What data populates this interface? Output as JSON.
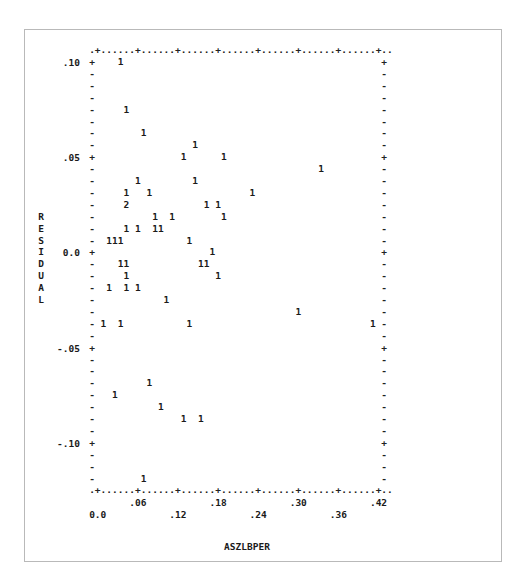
{
  "chart_data": {
    "type": "scatter",
    "title": "",
    "xlabel": "ASZLBPER",
    "ylabel": "RESIDUAL",
    "x_ticks": [
      "0.0",
      ".06",
      ".12",
      ".18",
      ".24",
      ".30",
      ".36",
      ".42"
    ],
    "y_ticks": [
      ".10",
      ".05",
      "0.0",
      "-.05",
      "-.10"
    ],
    "xlim": [
      0.0,
      0.42
    ],
    "ylim": [
      -0.125,
      0.1
    ],
    "grid": false,
    "legend": "symbols denote number of observations at plotted position",
    "points": [
      {
        "row": 0,
        "col": 5,
        "sym": "1",
        "x": 0.034,
        "y": 0.1
      },
      {
        "row": 4,
        "col": 6,
        "sym": "1",
        "x": 0.043,
        "y": 0.075
      },
      {
        "row": 6,
        "col": 9,
        "sym": "1",
        "x": 0.069,
        "y": 0.0625
      },
      {
        "row": 7,
        "col": 18,
        "sym": "1",
        "x": 0.146,
        "y": 0.056
      },
      {
        "row": 8,
        "col": 16,
        "sym": "1",
        "x": 0.129,
        "y": 0.05
      },
      {
        "row": 8,
        "col": 23,
        "sym": "1",
        "x": 0.189,
        "y": 0.05
      },
      {
        "row": 9,
        "col": 40,
        "sym": "1",
        "x": 0.334,
        "y": 0.044
      },
      {
        "row": 10,
        "col": 8,
        "sym": "1",
        "x": 0.06,
        "y": 0.0375
      },
      {
        "row": 10,
        "col": 18,
        "sym": "1",
        "x": 0.146,
        "y": 0.0375
      },
      {
        "row": 11,
        "col": 6,
        "sym": "1",
        "x": 0.043,
        "y": 0.031
      },
      {
        "row": 11,
        "col": 10,
        "sym": "1",
        "x": 0.077,
        "y": 0.031
      },
      {
        "row": 11,
        "col": 28,
        "sym": "1",
        "x": 0.231,
        "y": 0.031
      },
      {
        "row": 12,
        "col": 6,
        "sym": "2",
        "x": 0.043,
        "y": 0.025
      },
      {
        "row": 12,
        "col": 20,
        "sym": "1",
        "x": 0.163,
        "y": 0.025
      },
      {
        "row": 12,
        "col": 22,
        "sym": "1",
        "x": 0.18,
        "y": 0.025
      },
      {
        "row": 13,
        "col": 11,
        "sym": "1",
        "x": 0.086,
        "y": 0.019
      },
      {
        "row": 13,
        "col": 14,
        "sym": "1",
        "x": 0.111,
        "y": 0.019
      },
      {
        "row": 13,
        "col": 23,
        "sym": "1",
        "x": 0.189,
        "y": 0.019
      },
      {
        "row": 14,
        "col": 6,
        "sym": "1",
        "x": 0.043,
        "y": 0.0125
      },
      {
        "row": 14,
        "col": 8,
        "sym": "1",
        "x": 0.06,
        "y": 0.0125
      },
      {
        "row": 14,
        "col": 11,
        "sym": "1",
        "x": 0.086,
        "y": 0.0125
      },
      {
        "row": 14,
        "col": 12,
        "sym": "1",
        "x": 0.094,
        "y": 0.0125
      },
      {
        "row": 15,
        "col": 3,
        "sym": "1",
        "x": 0.017,
        "y": 0.006
      },
      {
        "row": 15,
        "col": 4,
        "sym": "1",
        "x": 0.026,
        "y": 0.006
      },
      {
        "row": 15,
        "col": 5,
        "sym": "1",
        "x": 0.034,
        "y": 0.006
      },
      {
        "row": 15,
        "col": 17,
        "sym": "1",
        "x": 0.137,
        "y": 0.006
      },
      {
        "row": 16,
        "col": 21,
        "sym": "1",
        "x": 0.171,
        "y": 0.0
      },
      {
        "row": 17,
        "col": 5,
        "sym": "1",
        "x": 0.034,
        "y": -0.006
      },
      {
        "row": 17,
        "col": 6,
        "sym": "1",
        "x": 0.043,
        "y": -0.006
      },
      {
        "row": 17,
        "col": 19,
        "sym": "1",
        "x": 0.154,
        "y": -0.006
      },
      {
        "row": 17,
        "col": 20,
        "sym": "1",
        "x": 0.163,
        "y": -0.006
      },
      {
        "row": 18,
        "col": 6,
        "sym": "1",
        "x": 0.043,
        "y": -0.0125
      },
      {
        "row": 18,
        "col": 22,
        "sym": "1",
        "x": 0.18,
        "y": -0.0125
      },
      {
        "row": 19,
        "col": 3,
        "sym": "1",
        "x": 0.017,
        "y": -0.019
      },
      {
        "row": 19,
        "col": 6,
        "sym": "1",
        "x": 0.043,
        "y": -0.019
      },
      {
        "row": 19,
        "col": 8,
        "sym": "1",
        "x": 0.06,
        "y": -0.019
      },
      {
        "row": 20,
        "col": 13,
        "sym": "1",
        "x": 0.103,
        "y": -0.025
      },
      {
        "row": 21,
        "col": 36,
        "sym": "1",
        "x": 0.3,
        "y": -0.031
      },
      {
        "row": 22,
        "col": 2,
        "sym": "1",
        "x": 0.009,
        "y": -0.0375
      },
      {
        "row": 22,
        "col": 5,
        "sym": "1",
        "x": 0.034,
        "y": -0.0375
      },
      {
        "row": 22,
        "col": 17,
        "sym": "1",
        "x": 0.137,
        "y": -0.0375
      },
      {
        "row": 22,
        "col": 49,
        "sym": "1",
        "x": 0.411,
        "y": -0.0375
      },
      {
        "row": 27,
        "col": 10,
        "sym": "1",
        "x": 0.077,
        "y": -0.069
      },
      {
        "row": 28,
        "col": 4,
        "sym": "1",
        "x": 0.026,
        "y": -0.075
      },
      {
        "row": 29,
        "col": 12,
        "sym": "1",
        "x": 0.094,
        "y": -0.081
      },
      {
        "row": 30,
        "col": 16,
        "sym": "1",
        "x": 0.129,
        "y": -0.0875
      },
      {
        "row": 30,
        "col": 19,
        "sym": "1",
        "x": 0.154,
        "y": -0.0875
      },
      {
        "row": 35,
        "col": 9,
        "sym": "1",
        "x": 0.069,
        "y": -0.119
      }
    ],
    "n_observations": 49
  },
  "layout": {
    "x0": 92,
    "y0": 62,
    "col_w": 5.73,
    "row_h": 11.9,
    "n_rows": 36,
    "right_col": 51,
    "x_tick_cols": [
      1,
      8,
      15,
      22,
      29,
      36,
      43,
      50
    ],
    "y_tick_rows": [
      0,
      8,
      16,
      24,
      32
    ],
    "ylabel_start_row": 13
  }
}
